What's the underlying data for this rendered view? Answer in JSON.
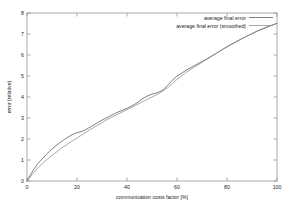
{
  "chart_data": {
    "type": "line",
    "title": "",
    "xlabel": "communication costs factor [%]",
    "ylabel": "error (relative)",
    "xlim": [
      0,
      100
    ],
    "ylim": [
      0,
      8
    ],
    "xticks": [
      "0",
      "20",
      "40",
      "60",
      "80",
      "100"
    ],
    "xtick_values": [
      0,
      20,
      40,
      60,
      80,
      100
    ],
    "yticks": [
      "0",
      "1",
      "2",
      "3",
      "4",
      "5",
      "6",
      "7",
      "8"
    ],
    "ytick_values": [
      0,
      1,
      2,
      3,
      4,
      5,
      6,
      7,
      8
    ],
    "grid": false,
    "legend_position": "top-right",
    "legend_entries": [
      "average final error",
      "average final error (smoothed)"
    ],
    "series": [
      {
        "name": "average final error",
        "color": "#555555",
        "x": [
          0,
          2,
          4,
          6,
          8,
          10,
          12,
          14,
          16,
          18,
          20,
          22,
          24,
          26,
          28,
          30,
          32,
          34,
          36,
          38,
          40,
          42,
          44,
          46,
          48,
          50,
          52,
          54,
          56,
          58,
          60,
          64,
          68,
          72,
          76,
          80,
          84,
          88,
          92,
          96,
          100
        ],
        "y": [
          0.0,
          0.42,
          0.78,
          1.05,
          1.3,
          1.52,
          1.72,
          1.9,
          2.06,
          2.2,
          2.3,
          2.36,
          2.48,
          2.62,
          2.76,
          2.9,
          3.02,
          3.14,
          3.26,
          3.36,
          3.46,
          3.58,
          3.72,
          3.9,
          4.04,
          4.14,
          4.2,
          4.3,
          4.52,
          4.78,
          5.0,
          5.3,
          5.56,
          5.82,
          6.1,
          6.4,
          6.66,
          6.9,
          7.14,
          7.34,
          7.5
        ]
      },
      {
        "name": "average final error (smoothed)",
        "color": "#8c8c8c",
        "x": [
          0,
          2,
          4,
          6,
          8,
          10,
          12,
          14,
          16,
          18,
          20,
          22,
          24,
          26,
          28,
          30,
          32,
          34,
          36,
          38,
          40,
          42,
          44,
          46,
          48,
          50,
          52,
          54,
          56,
          58,
          60,
          64,
          68,
          72,
          76,
          80,
          84,
          88,
          92,
          96,
          100
        ],
        "y": [
          0.0,
          0.3,
          0.58,
          0.82,
          1.02,
          1.22,
          1.4,
          1.58,
          1.74,
          1.9,
          2.04,
          2.2,
          2.36,
          2.5,
          2.64,
          2.78,
          2.92,
          3.04,
          3.16,
          3.28,
          3.4,
          3.52,
          3.64,
          3.76,
          3.88,
          4.0,
          4.12,
          4.26,
          4.42,
          4.62,
          4.84,
          5.2,
          5.5,
          5.8,
          6.1,
          6.38,
          6.64,
          6.9,
          7.12,
          7.32,
          7.52
        ]
      }
    ]
  }
}
